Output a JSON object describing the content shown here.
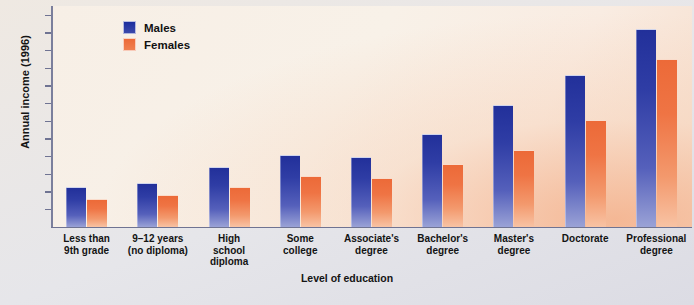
{
  "chart_data": {
    "type": "bar",
    "title": "",
    "xlabel": "Level of education",
    "ylabel": "Annual income (1996)",
    "ylim": [
      0,
      120000
    ],
    "ytick_labels": [
      "$120,000",
      "110,000",
      "100,000",
      "90,000",
      "80,000",
      "70,000",
      "60,000",
      "50,000",
      "40,000",
      "30,000",
      "20,000",
      "10,000"
    ],
    "ytick_values": [
      120000,
      110000,
      100000,
      90000,
      80000,
      70000,
      60000,
      50000,
      40000,
      30000,
      20000,
      10000
    ],
    "grid": false,
    "legend_position": "top-left",
    "categories": [
      "Less than 9th grade",
      "9–12 years (no diploma)",
      "High school diploma",
      "Some college",
      "Associate's degree",
      "Bachelor's degree",
      "Master's degree",
      "Doctorate",
      "Professional degree"
    ],
    "category_lines": [
      [
        "Less than",
        "9th grade"
      ],
      [
        "9–12 years",
        "(no diploma)"
      ],
      [
        "High",
        "school",
        "diploma"
      ],
      [
        "Some",
        "college"
      ],
      [
        "Associate's",
        "degree"
      ],
      [
        "Bachelor's",
        "degree"
      ],
      [
        "Master's",
        "degree"
      ],
      [
        "Doctorate"
      ],
      [
        "Professional",
        "degree"
      ]
    ],
    "series": [
      {
        "name": "Males",
        "color": "#22309a",
        "values": [
          22000,
          24000,
          33000,
          40000,
          39000,
          52000,
          68000,
          85000,
          111000
        ]
      },
      {
        "name": "Females",
        "color": "#ec6a38",
        "values": [
          15000,
          17500,
          22000,
          28000,
          27000,
          35000,
          43000,
          60000,
          94000
        ]
      }
    ]
  },
  "legend": {
    "items": [
      {
        "label": "Males"
      },
      {
        "label": "Females"
      }
    ]
  }
}
